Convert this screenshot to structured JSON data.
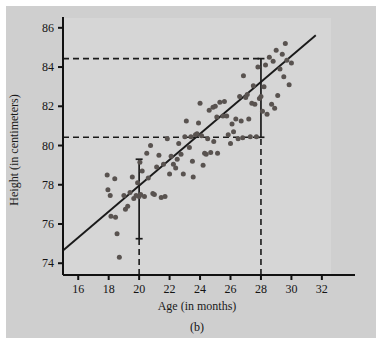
{
  "figure": {
    "caption": "(b)",
    "background_color": "#cfcfcf",
    "plot_background_color": "#d6d6d6",
    "point_color": "#595350",
    "line_color": "#1a1a1a",
    "axis_color": "#111111"
  },
  "chart_data": {
    "type": "scatter",
    "title": "",
    "xlabel": "Age (in months)",
    "ylabel": "Height (in centimeters)",
    "xlim": [
      15,
      32.6
    ],
    "ylim": [
      73.4,
      86.5
    ],
    "xticks": [
      16,
      18,
      20,
      22,
      24,
      26,
      28,
      30,
      32
    ],
    "xticklabels": [
      "16",
      "18",
      "20",
      "22",
      "24",
      "26",
      "28",
      "30",
      "32"
    ],
    "yticks": [
      74,
      76,
      78,
      80,
      82,
      84,
      86
    ],
    "yticklabels": [
      "74",
      "76",
      "78",
      "80",
      "82",
      "84",
      "86"
    ],
    "grid": false,
    "legend": null,
    "regression_line": {
      "x": [
        15.0,
        31.6
      ],
      "y": [
        74.65,
        85.62
      ],
      "slope": 0.661,
      "intercept": 64.73
    },
    "annotations": [
      {
        "name": "interval-bar-at-20",
        "type": "vertical-interval",
        "x": 20,
        "y_low": 75.25,
        "y_high": 79.3,
        "style": "solid-with-caps"
      },
      {
        "name": "interval-bar-at-28",
        "type": "vertical-interval",
        "x": 28,
        "y_low": 80.42,
        "y_high": 84.43,
        "style": "solid-with-caps"
      },
      {
        "name": "dashed-drop-line-at-20",
        "type": "vertical-dashed",
        "x": 20,
        "y_low": 73.4,
        "y_high": 75.25
      },
      {
        "name": "dashed-drop-line-at-28",
        "type": "vertical-dashed",
        "x": 28,
        "y_low": 73.4,
        "y_high": 80.42
      },
      {
        "name": "dashed-upper-reference-line",
        "type": "horizontal-dashed",
        "y": 84.43,
        "x_low": 15,
        "x_high": 28
      },
      {
        "name": "dashed-lower-reference-line",
        "type": "horizontal-dashed",
        "y": 80.42,
        "x_low": 15,
        "x_high": 28
      }
    ],
    "points": [
      [
        17.9,
        78.5
      ],
      [
        17.95,
        77.75
      ],
      [
        18.1,
        77.45
      ],
      [
        18.15,
        76.4
      ],
      [
        18.4,
        78.3
      ],
      [
        18.45,
        76.35
      ],
      [
        18.55,
        75.5
      ],
      [
        18.7,
        74.3
      ],
      [
        19.0,
        77.45
      ],
      [
        19.1,
        76.75
      ],
      [
        19.25,
        76.9
      ],
      [
        19.4,
        77.6
      ],
      [
        19.55,
        78.4
      ],
      [
        19.65,
        77.3
      ],
      [
        19.8,
        77.45
      ],
      [
        19.9,
        78.1
      ],
      [
        20.0,
        77.4
      ],
      [
        20.05,
        79.15
      ],
      [
        20.1,
        77.5
      ],
      [
        20.2,
        78.7
      ],
      [
        20.35,
        77.4
      ],
      [
        20.5,
        79.6
      ],
      [
        20.6,
        78.35
      ],
      [
        20.75,
        80.0
      ],
      [
        20.9,
        77.55
      ],
      [
        21.0,
        77.5
      ],
      [
        21.15,
        78.9
      ],
      [
        21.3,
        79.5
      ],
      [
        21.45,
        77.35
      ],
      [
        21.6,
        79.05
      ],
      [
        21.7,
        77.4
      ],
      [
        21.85,
        80.35
      ],
      [
        22.0,
        78.55
      ],
      [
        22.1,
        79.45
      ],
      [
        22.25,
        79.05
      ],
      [
        22.4,
        78.85
      ],
      [
        22.5,
        79.3
      ],
      [
        22.6,
        80.1
      ],
      [
        22.75,
        79.55
      ],
      [
        22.9,
        78.55
      ],
      [
        23.0,
        80.45
      ],
      [
        23.1,
        81.25
      ],
      [
        23.3,
        79.9
      ],
      [
        23.4,
        80.45
      ],
      [
        23.5,
        79.2
      ],
      [
        23.55,
        78.4
      ],
      [
        23.7,
        80.55
      ],
      [
        23.8,
        80.6
      ],
      [
        23.9,
        81.15
      ],
      [
        24.0,
        82.15
      ],
      [
        24.1,
        80.5
      ],
      [
        24.2,
        79.0
      ],
      [
        24.3,
        79.6
      ],
      [
        24.4,
        79.55
      ],
      [
        24.5,
        80.35
      ],
      [
        24.6,
        81.8
      ],
      [
        24.7,
        79.65
      ],
      [
        24.85,
        81.95
      ],
      [
        24.9,
        80.2
      ],
      [
        25.0,
        82.0
      ],
      [
        25.1,
        81.45
      ],
      [
        25.15,
        79.6
      ],
      [
        25.3,
        82.2
      ],
      [
        25.5,
        81.5
      ],
      [
        25.6,
        82.25
      ],
      [
        25.75,
        81.5
      ],
      [
        25.85,
        80.55
      ],
      [
        26.0,
        80.1
      ],
      [
        26.1,
        81.1
      ],
      [
        26.2,
        80.7
      ],
      [
        26.35,
        81.35
      ],
      [
        26.5,
        80.35
      ],
      [
        26.6,
        82.5
      ],
      [
        26.7,
        81.25
      ],
      [
        26.8,
        80.4
      ],
      [
        26.85,
        83.55
      ],
      [
        27.0,
        82.45
      ],
      [
        27.1,
        82.6
      ],
      [
        27.2,
        81.35
      ],
      [
        27.3,
        80.45
      ],
      [
        27.4,
        82.15
      ],
      [
        27.5,
        83.05
      ],
      [
        27.6,
        82.1
      ],
      [
        27.7,
        80.45
      ],
      [
        27.8,
        84.0
      ],
      [
        27.9,
        82.4
      ],
      [
        28.0,
        82.5
      ],
      [
        28.1,
        81.75
      ],
      [
        28.2,
        83.0
      ],
      [
        28.3,
        84.1
      ],
      [
        28.4,
        81.6
      ],
      [
        28.55,
        84.5
      ],
      [
        28.7,
        82.1
      ],
      [
        28.8,
        84.3
      ],
      [
        28.9,
        81.9
      ],
      [
        29.0,
        84.85
      ],
      [
        29.1,
        82.55
      ],
      [
        29.25,
        83.9
      ],
      [
        29.4,
        84.65
      ],
      [
        29.5,
        83.5
      ],
      [
        29.6,
        85.2
      ],
      [
        29.7,
        84.35
      ],
      [
        29.85,
        83.1
      ],
      [
        30.0,
        84.2
      ]
    ]
  }
}
